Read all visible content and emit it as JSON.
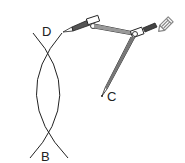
{
  "diagram": {
    "points": {
      "D": "D",
      "B": "B",
      "C": "C"
    },
    "icons": {
      "compass": "compass-icon",
      "pencil": "pencil-icon"
    },
    "colors": {
      "stroke": "#222222",
      "background": "#ffffff",
      "pencil_icon": "#888888"
    }
  }
}
